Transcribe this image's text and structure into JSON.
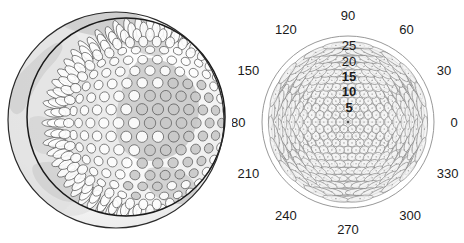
{
  "figure": {
    "title": "",
    "background_color": "#ffffff",
    "width": 464,
    "height": 243,
    "panels": [
      {
        "name": "globe-panel",
        "description": "Orthographic globe view with hexagonal cell tessellation overlay"
      },
      {
        "name": "polar-panel",
        "description": "Polar plot of antenna beam footprints"
      }
    ]
  },
  "globe": {
    "name": "globe-cell-pattern",
    "outer_limb_color": "#2a2a2a",
    "inner_circle_color": "#1a1a1a",
    "cell_outline_color": "#4a4a4a",
    "land_shade_color": "#b9b9b9",
    "ocean_shade_color": "#e8e8e8",
    "cell_fill_light": "#fdfdfd",
    "cell_fill_dark": "#c9c9c9",
    "center": {
      "x": 116,
      "y": 120
    },
    "outer_radius": 108,
    "inner_radius": 99,
    "inner_offset": {
      "x": 10,
      "y": -3
    },
    "cell_rows": 17,
    "cell_spacing": 11.4
  },
  "chart_data": {
    "type": "scatter",
    "name": "polar-beam-footprint-plot",
    "title": "",
    "subtitle": "",
    "xlabel": "",
    "ylabel": "",
    "projection": "polar",
    "grid": true,
    "legend": null,
    "theta_unit": "degrees",
    "theta_direction": "counterclockwise",
    "theta_zero_location": "E",
    "angular_ticks": [
      0,
      30,
      60,
      90,
      120,
      150,
      180,
      210,
      240,
      270,
      300,
      330
    ],
    "angular_tick_labels": [
      "0",
      "30",
      "60",
      "90",
      "120",
      "150",
      "180",
      "210",
      "240",
      "270",
      "300",
      "330"
    ],
    "radial_ticks": [
      5,
      10,
      15,
      20,
      25
    ],
    "radial_tick_labels": [
      "5",
      "10",
      "15",
      "20",
      "25"
    ],
    "rlim": [
      0,
      25
    ],
    "radial_tick_label_angle": 90,
    "outer_boundary_radius": 28,
    "outer_boundary_color": "#8c8c8c",
    "grid_color": "#9a9a9a",
    "spoke_color": "#8a8a8a",
    "marker_outline_color": "#777777",
    "marker_fill_color": "#f2f2f2",
    "rings": [
      {
        "r": 0,
        "count": 1,
        "marker_r": 0.9
      },
      {
        "r": 3.1,
        "count": 6,
        "marker_r": 1.6
      },
      {
        "r": 5.4,
        "count": 12,
        "marker_r": 1.6
      },
      {
        "r": 8.0,
        "count": 18,
        "marker_r": 1.6
      },
      {
        "r": 10.6,
        "count": 24,
        "marker_r": 1.7
      },
      {
        "r": 13.3,
        "count": 30,
        "marker_r": 1.8
      },
      {
        "r": 16.0,
        "count": 36,
        "marker_r": 1.9
      },
      {
        "r": 18.8,
        "count": 42,
        "marker_r": 2.0
      },
      {
        "r": 21.6,
        "count": 48,
        "marker_r": 2.1
      },
      {
        "r": 24.3,
        "count": 54,
        "marker_r": 2.2
      }
    ],
    "hex_lattice": {
      "description": "Markers laid out on a hexagonal lattice clipped to r<=25, drawn as ellipses elongated radially near the rim",
      "spacing": 2.62,
      "max_radius": 25.6
    }
  },
  "labels": {
    "angle_0": "0",
    "angle_30": "30",
    "angle_60": "60",
    "angle_90": "90",
    "angle_120": "120",
    "angle_150": "150",
    "angle_180": "180",
    "angle_210": "210",
    "angle_240": "240",
    "angle_270": "270",
    "angle_300": "300",
    "angle_330": "330",
    "radius_5": "5",
    "radius_10": "10",
    "radius_15": "15",
    "radius_20": "20",
    "radius_25": "25"
  }
}
